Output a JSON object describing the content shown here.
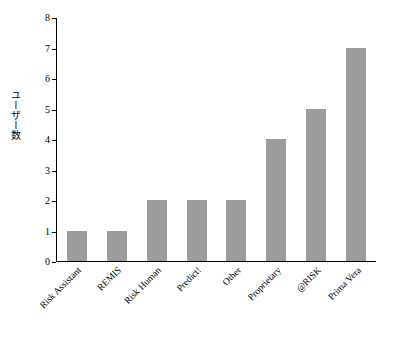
{
  "chart_data": {
    "type": "bar",
    "title": "",
    "xlabel": "",
    "ylabel": "ユーザー数",
    "categories": [
      "Risk Assistant",
      "REMIS",
      "Risk Human",
      "Predict!",
      "Other",
      "Proprietary",
      "@RISK",
      "Prima Vera"
    ],
    "values": [
      1,
      1,
      2,
      2,
      2,
      4,
      5,
      7
    ],
    "ylim": [
      0,
      8
    ],
    "yticks": [
      0,
      1,
      2,
      3,
      4,
      5,
      6,
      7,
      8
    ],
    "ytick_labels": [
      "0",
      "1",
      "2",
      "3",
      "4",
      "5",
      "6",
      "7",
      "8"
    ],
    "grid": false,
    "legend": false,
    "bar_color": "#9c9c9c",
    "axis_color": "#000000"
  }
}
